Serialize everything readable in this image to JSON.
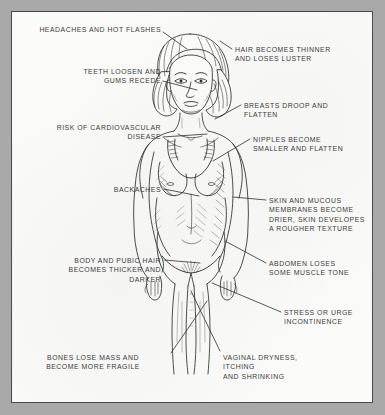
{
  "plate": {
    "title": "Effects Of Menopause On The Female Body",
    "background_color": "#a9a9a9",
    "paper_color": "#fbfbf9",
    "frame_color": "#4a4a4a",
    "ink_color": "#3b3b3b"
  },
  "figure": {
    "style": "pen-and-ink cross-hatched medical illustration",
    "orientation": "frontal view"
  },
  "labels": [
    {
      "id": "headaches",
      "text": "HEADACHES AND HOT FLASHES",
      "side": "left",
      "align": "right",
      "text_x": 20,
      "text_y": 24,
      "text_w": 140,
      "leader": "M162,31 L186,48"
    },
    {
      "id": "teeth",
      "text": "TEETH LOOSEN AND\nGUMS RECEDE",
      "side": "left",
      "align": "right",
      "text_x": 30,
      "text_y": 66,
      "text_w": 130,
      "leader": "M162,80 L196,89"
    },
    {
      "id": "cardiovascular",
      "text": "RISK OF CARDIOVASCULAR\nDISEASE",
      "side": "left",
      "align": "right",
      "text_x": 18,
      "text_y": 122,
      "text_w": 142,
      "leader": "M162,136 L206,133"
    },
    {
      "id": "backaches",
      "text": "BACKACHES",
      "side": "left",
      "align": "right",
      "text_x": 60,
      "text_y": 184,
      "text_w": 100,
      "leader": "M163,188 L198,195"
    },
    {
      "id": "body-hair",
      "text": "BODY AND PUBIC HAIR\nBECOMES THICKER AND\nDARKER",
      "side": "left",
      "align": "right",
      "text_x": 25,
      "text_y": 255,
      "text_w": 135,
      "leader": "M163,259 L199,262"
    },
    {
      "id": "bones",
      "text": "BONES LOSE MASS AND\nBECOME MORE FRAGILE",
      "side": "left",
      "align": "center",
      "text_x": 18,
      "text_y": 352,
      "text_w": 148,
      "leader": "M170,352 L206,300"
    },
    {
      "id": "hair-thinner",
      "text": "HAIR BECOMES THINNER\nAND LOSES LUSTER",
      "side": "right",
      "align": "left",
      "text_x": 234,
      "text_y": 44,
      "text_w": 142,
      "leader": "M231,48 L219,40"
    },
    {
      "id": "breasts",
      "text": "BREASTS DROOP AND\nFLATTEN",
      "side": "right",
      "align": "left",
      "text_x": 243,
      "text_y": 100,
      "text_w": 134,
      "leader": "M240,104 L214,118"
    },
    {
      "id": "nipples",
      "text": "NIPPLES BECOME\nSMALLER AND FLATTEN",
      "side": "right",
      "align": "left",
      "text_x": 252,
      "text_y": 134,
      "text_w": 126,
      "leader": "M249,138 L212,160"
    },
    {
      "id": "skin",
      "text": "SKIN AND MUCOUS\nMEMBRANES BECOME\nDRIER, SKIN DEVELOPES\nA ROUGHER TEXTURE",
      "side": "right",
      "align": "left",
      "text_x": 268,
      "text_y": 195,
      "text_w": 112,
      "leader": "M265,199 L232,196"
    },
    {
      "id": "abdomen",
      "text": "ABDOMEN LOSES\nSOME MUSCLE TONE",
      "side": "right",
      "align": "left",
      "text_x": 268,
      "text_y": 258,
      "text_w": 112,
      "leader": "M265,262 L224,240"
    },
    {
      "id": "incontinence",
      "text": "STRESS OR URGE\nINCONTINENCE",
      "side": "right",
      "align": "left",
      "text_x": 283,
      "text_y": 307,
      "text_w": 100,
      "leader": "M280,311 L211,282"
    },
    {
      "id": "vaginal",
      "text": "VAGINAL DRYNESS,\nITCHING\nAND SHRINKING",
      "side": "right",
      "align": "left",
      "text_x": 222,
      "text_y": 352,
      "text_w": 112,
      "leader": "M219,350 L190,290"
    }
  ]
}
